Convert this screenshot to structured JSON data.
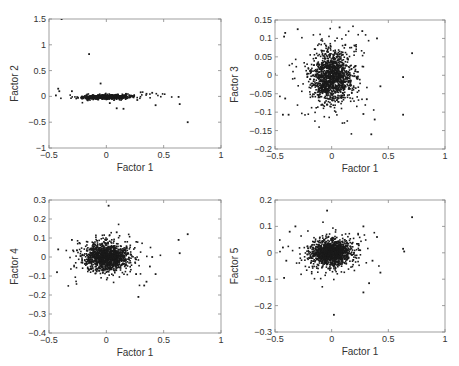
{
  "chart_data": [
    {
      "type": "scatter",
      "id": "f1_f2",
      "xlabel": "Factor 1",
      "ylabel": "Factor 2",
      "xlim": [
        -0.5,
        1
      ],
      "ylim": [
        -1,
        1.5
      ],
      "xticks": [
        -0.5,
        0,
        0.5,
        1
      ],
      "xtick_labels": [
        "-0.5",
        "0",
        "0.5",
        "1"
      ],
      "yticks": [
        -1,
        -0.5,
        0,
        0.5,
        1,
        1.5
      ],
      "ytick_labels": [
        "-1",
        "-0.5",
        "0",
        "0.5",
        "1",
        "1.5"
      ],
      "box": [
        49,
        19,
        221,
        148
      ],
      "cluster": {
        "cx": 0.0,
        "cy": -0.01,
        "sx": 0.1,
        "sy": 0.02,
        "n": 700,
        "corr": 0.25
      },
      "outliers": [
        [
          -0.39,
          1.5
        ],
        [
          -0.15,
          0.82
        ],
        [
          -0.05,
          0.25
        ],
        [
          -0.42,
          0.15
        ],
        [
          -0.41,
          0.1
        ],
        [
          -0.44,
          0.02
        ],
        [
          0.63,
          -0.01
        ],
        [
          0.64,
          -0.15
        ],
        [
          0.71,
          -0.5
        ],
        [
          0.43,
          -0.17
        ],
        [
          0.09,
          -0.23
        ],
        [
          0.15,
          -0.24
        ],
        [
          0.03,
          -0.13
        ],
        [
          0.35,
          0.05
        ],
        [
          0.4,
          0.07
        ],
        [
          0.27,
          -0.07
        ],
        [
          -0.3,
          0.1
        ],
        [
          0.3,
          0.08
        ]
      ]
    },
    {
      "type": "scatter",
      "id": "f1_f3",
      "xlabel": "Factor 1",
      "ylabel": "Factor 3",
      "xlim": [
        -0.5,
        1
      ],
      "ylim": [
        -0.2,
        0.15
      ],
      "xticks": [
        -0.5,
        0,
        0.5,
        1
      ],
      "xtick_labels": [
        "-0.5",
        "0",
        "0.5",
        "1"
      ],
      "yticks": [
        -0.2,
        -0.15,
        -0.1,
        -0.05,
        0,
        0.05,
        0.1,
        0.15
      ],
      "ytick_labels": [
        "-0.2",
        "-0.15",
        "-0.1",
        "-0.05",
        "0",
        "0.05",
        "0.1",
        "0.15"
      ],
      "box": [
        275,
        20,
        445,
        149
      ],
      "cluster": {
        "cx": 0.0,
        "cy": -0.005,
        "sx": 0.09,
        "sy": 0.035,
        "n": 1300,
        "corr": 0.0
      },
      "outliers": [
        [
          0.71,
          0.06
        ],
        [
          0.63,
          -0.005
        ],
        [
          0.63,
          -0.107
        ],
        [
          0.35,
          -0.16
        ],
        [
          0.43,
          -0.03
        ],
        [
          0.4,
          0.1
        ],
        [
          -0.42,
          0.105
        ],
        [
          -0.41,
          0.115
        ],
        [
          -0.43,
          -0.107
        ],
        [
          -0.38,
          -0.107
        ],
        [
          -0.41,
          -0.063
        ],
        [
          0.07,
          0.13
        ],
        [
          -0.3,
          0.125
        ],
        [
          0.27,
          0.12
        ],
        [
          0.38,
          -0.12
        ],
        [
          0.31,
          -0.065
        ],
        [
          0.28,
          -0.105
        ]
      ]
    },
    {
      "type": "scatter",
      "id": "f1_f4",
      "xlabel": "Factor 1",
      "ylabel": "Factor 4",
      "xlim": [
        -0.5,
        1
      ],
      "ylim": [
        -0.4,
        0.3
      ],
      "xticks": [
        -0.5,
        0,
        0.5,
        1
      ],
      "xtick_labels": [
        "-0.5",
        "0",
        "0.5",
        "1"
      ],
      "yticks": [
        -0.4,
        -0.3,
        -0.2,
        -0.1,
        0,
        0.1,
        0.2,
        0.3
      ],
      "ytick_labels": [
        "-0.4",
        "-0.3",
        "-0.2",
        "-0.1",
        "0",
        "0.1",
        "0.2",
        "0.3"
      ],
      "box": [
        49,
        200,
        221,
        333
      ],
      "cluster": {
        "cx": 0.0,
        "cy": 0.0,
        "sx": 0.09,
        "sy": 0.035,
        "n": 1300,
        "corr": 0.0
      },
      "outliers": [
        [
          0.02,
          0.27
        ],
        [
          0.71,
          0.12
        ],
        [
          0.63,
          0.09
        ],
        [
          0.64,
          0.02
        ],
        [
          0.28,
          -0.21
        ],
        [
          0.33,
          -0.15
        ],
        [
          0.35,
          -0.13
        ],
        [
          0.43,
          -0.09
        ],
        [
          0.26,
          -0.09
        ],
        [
          -0.43,
          -0.08
        ],
        [
          -0.42,
          0.04
        ],
        [
          0.09,
          0.13
        ],
        [
          0.38,
          -0.05
        ],
        [
          0.4,
          0.0
        ],
        [
          -0.3,
          0.09
        ]
      ]
    },
    {
      "type": "scatter",
      "id": "f1_f5",
      "xlabel": "Factor 1",
      "ylabel": "Factor 5",
      "xlim": [
        -0.5,
        1
      ],
      "ylim": [
        -0.3,
        0.2
      ],
      "xticks": [
        -0.5,
        0,
        0.5,
        1
      ],
      "xtick_labels": [
        "-0.5",
        "0",
        "0.5",
        "1"
      ],
      "yticks": [
        -0.3,
        -0.2,
        -0.1,
        0,
        0.1,
        0.2
      ],
      "ytick_labels": [
        "-0.3",
        "-0.2",
        "-0.1",
        "0",
        "0.1",
        "0.2"
      ],
      "box": [
        275,
        200,
        445,
        332
      ],
      "cluster": {
        "cx": 0.0,
        "cy": 0.0,
        "sx": 0.09,
        "sy": 0.025,
        "n": 1300,
        "corr": 0.0
      },
      "outliers": [
        [
          -0.04,
          0.16
        ],
        [
          0.71,
          0.135
        ],
        [
          0.63,
          0.015
        ],
        [
          0.64,
          0.005
        ],
        [
          0.02,
          -0.235
        ],
        [
          0.28,
          -0.15
        ],
        [
          0.33,
          -0.115
        ],
        [
          0.43,
          -0.075
        ],
        [
          -0.42,
          -0.095
        ],
        [
          -0.43,
          0.02
        ],
        [
          -0.4,
          -0.03
        ],
        [
          -0.32,
          0.1
        ],
        [
          0.28,
          0.1
        ],
        [
          0.4,
          0.06
        ],
        [
          -0.37,
          0.08
        ],
        [
          0.36,
          -0.03
        ]
      ]
    }
  ]
}
